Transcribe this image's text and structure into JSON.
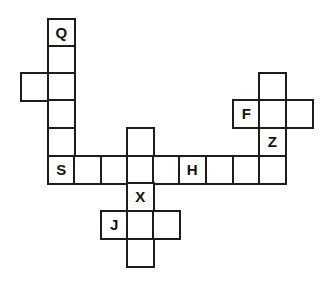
{
  "puzzle": {
    "type": "crossword-grid",
    "cells": [
      {
        "row": 0,
        "col": 1,
        "letter": "Q"
      },
      {
        "row": 1,
        "col": 1,
        "letter": ""
      },
      {
        "row": 2,
        "col": 0,
        "letter": ""
      },
      {
        "row": 2,
        "col": 1,
        "letter": ""
      },
      {
        "row": 3,
        "col": 1,
        "letter": ""
      },
      {
        "row": 4,
        "col": 1,
        "letter": ""
      },
      {
        "row": 5,
        "col": 1,
        "letter": "S"
      },
      {
        "row": 5,
        "col": 2,
        "letter": ""
      },
      {
        "row": 5,
        "col": 3,
        "letter": ""
      },
      {
        "row": 5,
        "col": 4,
        "letter": ""
      },
      {
        "row": 5,
        "col": 5,
        "letter": ""
      },
      {
        "row": 5,
        "col": 6,
        "letter": "H"
      },
      {
        "row": 5,
        "col": 7,
        "letter": ""
      },
      {
        "row": 5,
        "col": 8,
        "letter": ""
      },
      {
        "row": 5,
        "col": 9,
        "letter": ""
      },
      {
        "row": 4,
        "col": 4,
        "letter": ""
      },
      {
        "row": 6,
        "col": 4,
        "letter": "X"
      },
      {
        "row": 7,
        "col": 3,
        "letter": "J"
      },
      {
        "row": 7,
        "col": 4,
        "letter": ""
      },
      {
        "row": 7,
        "col": 5,
        "letter": ""
      },
      {
        "row": 8,
        "col": 4,
        "letter": ""
      },
      {
        "row": 2,
        "col": 9,
        "letter": ""
      },
      {
        "row": 3,
        "col": 8,
        "letter": "F"
      },
      {
        "row": 3,
        "col": 9,
        "letter": ""
      },
      {
        "row": 3,
        "col": 10,
        "letter": ""
      },
      {
        "row": 4,
        "col": 9,
        "letter": "Z"
      }
    ],
    "colors": {
      "grid_line": "#1c1c1c",
      "cell_fill": "#ffffff",
      "letter": "#111111"
    }
  }
}
